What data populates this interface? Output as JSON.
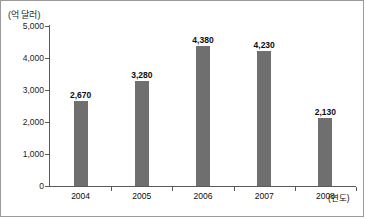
{
  "chart_data": {
    "type": "bar",
    "title": "",
    "subtitle": "",
    "xlabel": "(연도)",
    "ylabel": "(억 달러)",
    "categories": [
      "2004",
      "2005",
      "2006",
      "2007",
      "2008"
    ],
    "values": [
      2670,
      3280,
      4380,
      4230,
      2130
    ],
    "value_labels": [
      "2,670",
      "3,280",
      "4,380",
      "4,230",
      "2,130"
    ],
    "ylim": [
      0,
      5000
    ],
    "ytick_values": [
      0,
      1000,
      2000,
      3000,
      4000,
      5000
    ],
    "ytick_labels": [
      "0",
      "1,000",
      "2,000",
      "3,000",
      "4,000",
      "5,000"
    ],
    "grid": false,
    "legend": null,
    "series": [
      {
        "name": "",
        "values": [
          2670,
          3280,
          4380,
          4230,
          2130
        ],
        "color": "#6f6f6f"
      }
    ],
    "colors": {
      "bar": "#6f6f6f",
      "axis": "#5a5a5a",
      "frame": "#9a9a9a",
      "text": "#0d0d0d",
      "background": "#ffffff"
    }
  }
}
